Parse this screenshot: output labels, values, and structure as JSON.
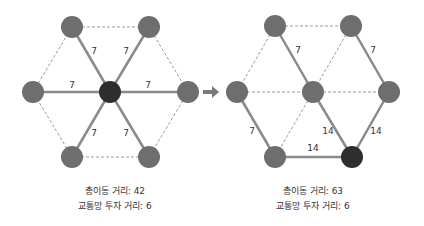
{
  "colors": {
    "node": "#6e6e6e",
    "hub": "#2e2e2e",
    "edge": "#8a8a8a",
    "dashed": "#9a9a9a",
    "text": "#333333",
    "arrow": "#7a7a7a"
  },
  "left": {
    "nodes": [
      {
        "id": "c",
        "x": 110,
        "y": 92,
        "hub": true
      },
      {
        "id": "tl",
        "x": 72,
        "y": 27
      },
      {
        "id": "tr",
        "x": 149,
        "y": 27
      },
      {
        "id": "l",
        "x": 33,
        "y": 92
      },
      {
        "id": "r",
        "x": 188,
        "y": 92
      },
      {
        "id": "bl",
        "x": 72,
        "y": 157
      },
      {
        "id": "br",
        "x": 149,
        "y": 157
      }
    ],
    "solid_edges": [
      {
        "from": "c",
        "to": "tl",
        "label": "7",
        "lx": 94,
        "ly": 54
      },
      {
        "from": "c",
        "to": "tr",
        "label": "7",
        "lx": 126,
        "ly": 54
      },
      {
        "from": "c",
        "to": "l",
        "label": "7",
        "lx": 72,
        "ly": 88
      },
      {
        "from": "c",
        "to": "r",
        "label": "7",
        "lx": 148,
        "ly": 88
      },
      {
        "from": "c",
        "to": "bl",
        "label": "7",
        "lx": 94,
        "ly": 136
      },
      {
        "from": "c",
        "to": "br",
        "label": "7",
        "lx": 126,
        "ly": 136
      }
    ],
    "dashed_edges": [
      [
        "tl",
        "tr"
      ],
      [
        "tr",
        "r"
      ],
      [
        "r",
        "br"
      ],
      [
        "br",
        "bl"
      ],
      [
        "bl",
        "l"
      ],
      [
        "l",
        "tl"
      ]
    ],
    "caption": {
      "line1": "총이동 거리: 42",
      "line2": "교통망 투자 거리: 6"
    }
  },
  "right": {
    "nodes": [
      {
        "id": "tl",
        "x": 275,
        "y": 26
      },
      {
        "id": "tr",
        "x": 351,
        "y": 26
      },
      {
        "id": "l",
        "x": 237,
        "y": 92
      },
      {
        "id": "c",
        "x": 313,
        "y": 92
      },
      {
        "id": "r",
        "x": 389,
        "y": 92
      },
      {
        "id": "bl",
        "x": 275,
        "y": 157
      },
      {
        "id": "br",
        "x": 352,
        "y": 157,
        "hub": true
      }
    ],
    "solid_edges": [
      {
        "from": "tl",
        "to": "c",
        "label": "7",
        "lx": 298,
        "ly": 53
      },
      {
        "from": "tr",
        "to": "r",
        "label": "7",
        "lx": 373,
        "ly": 53
      },
      {
        "from": "l",
        "to": "bl",
        "label": "7",
        "lx": 252,
        "ly": 134
      },
      {
        "from": "c",
        "to": "br",
        "label": "14",
        "lx": 328,
        "ly": 134
      },
      {
        "from": "r",
        "to": "br",
        "label": "14",
        "lx": 376,
        "ly": 134
      },
      {
        "from": "bl",
        "to": "br",
        "label": "14",
        "lx": 313,
        "ly": 151
      }
    ],
    "dashed_edges": [
      [
        "tl",
        "tr"
      ],
      [
        "tl",
        "l"
      ],
      [
        "l",
        "c"
      ],
      [
        "c",
        "r"
      ],
      [
        "tr",
        "c"
      ],
      [
        "c",
        "bl"
      ]
    ],
    "caption": {
      "line1": "총이동 거리: 63",
      "line2": "교통망 투자 거리: 6"
    }
  },
  "arrow": {
    "x1": 203,
    "x2": 219,
    "y": 92
  }
}
